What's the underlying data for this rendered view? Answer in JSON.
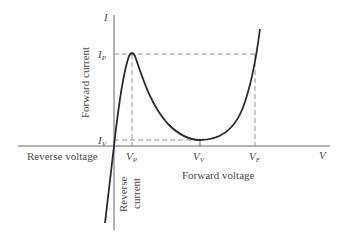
{
  "diagram": {
    "type": "tunnel-diode-IV-characteristic",
    "axes": {
      "y_axis_symbol": "I",
      "x_axis_symbol": "V",
      "y_axis_label": "Forward current",
      "x_axis_label_positive": "Forward voltage",
      "x_axis_label_negative": "Reverse voltage",
      "y_axis_label_negative": [
        "Reverse",
        "current"
      ]
    },
    "points": {
      "peak_current": {
        "base": "I",
        "sub": "P"
      },
      "valley_current": {
        "base": "I",
        "sub": "V"
      },
      "peak_voltage": {
        "base": "V",
        "sub": "P"
      },
      "valley_voltage": {
        "base": "V",
        "sub": "V"
      },
      "forward_voltage": {
        "base": "V",
        "sub": "F"
      }
    },
    "colors": {
      "curve": "#2a2a2a",
      "axes": "#555555",
      "dashed": "#777777",
      "text": "#4a4a4a"
    }
  }
}
